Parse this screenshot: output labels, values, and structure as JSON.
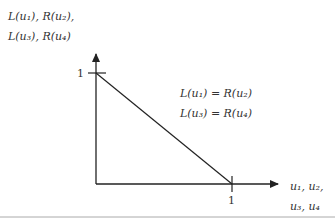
{
  "diagram": {
    "y_axis_label_line1": "L(u₁), R(u₂),",
    "y_axis_label_line2": "L(u₃), R(u₄)",
    "x_axis_label_line1": "u₁, u₂,",
    "x_axis_label_line2": "u₃, u₄",
    "y_tick_label": "1",
    "x_tick_label": "1",
    "equation_line1": "L(u₁) = R(u₂)",
    "equation_line2": "L(u₃) = R(u₄)",
    "line": {
      "from": [
        0,
        1
      ],
      "to": [
        1,
        0
      ]
    },
    "colors": {
      "axis": "#222222",
      "text": "#333333",
      "separator": "#aaaaaa"
    }
  }
}
